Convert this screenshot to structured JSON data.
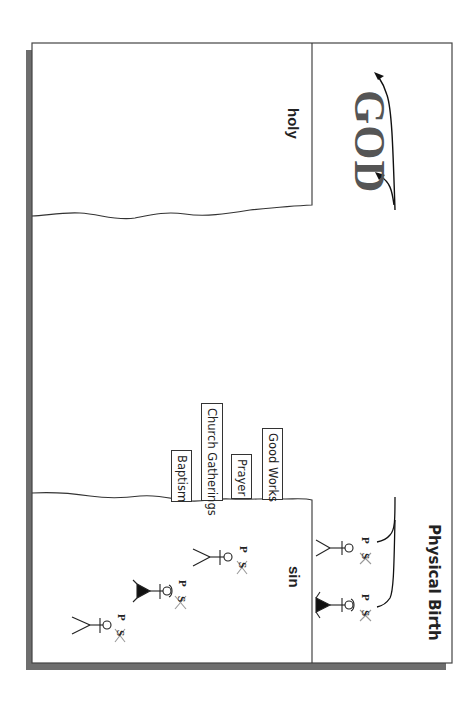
{
  "diagram": {
    "title": "GOD",
    "holy_label": "holy",
    "sin_label": "sin",
    "birth_label": "Physical Birth",
    "bridges": [
      {
        "label": "Good Works"
      },
      {
        "label": "Prayer"
      },
      {
        "label": "Church Gatherings"
      },
      {
        "label": "Baptism"
      }
    ],
    "figure_marks": {
      "p": "P",
      "s": "S"
    },
    "figures": [
      {
        "location": "birth",
        "gender": "male"
      },
      {
        "location": "birth",
        "gender": "female"
      },
      {
        "location": "sin",
        "gender": "male"
      },
      {
        "location": "sin",
        "gender": "female"
      },
      {
        "location": "sin",
        "gender": "male"
      }
    ],
    "orientation": "rotated 90 degrees clockwise",
    "colors": {
      "frame": "#333333",
      "shadow": "#6e6e6e",
      "god_text": "#555555",
      "line": "#222222"
    }
  }
}
